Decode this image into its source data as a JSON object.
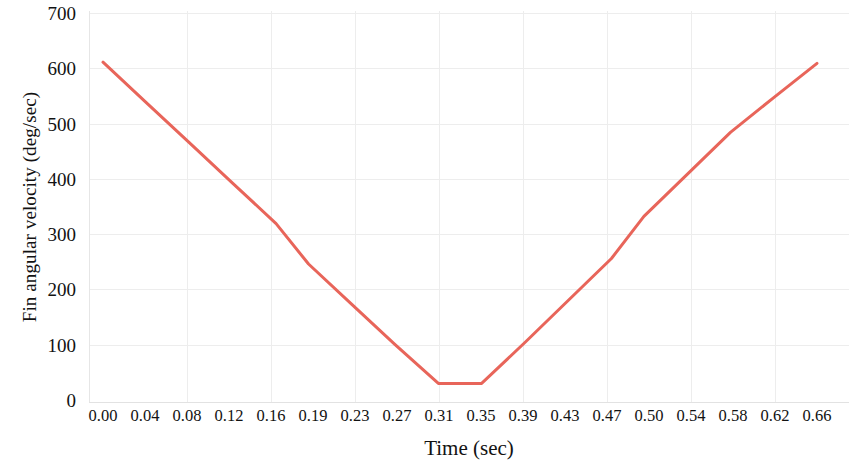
{
  "chart_data": {
    "type": "line",
    "title": "",
    "xlabel": "Time (sec)",
    "ylabel": "Fin angular velocity (deg/sec)",
    "xlim": [
      0.0,
      0.66
    ],
    "ylim": [
      0,
      700
    ],
    "grid": true,
    "legend": false,
    "line_color": "#E8655A",
    "line_width": 3,
    "background_color": "#FFFFFF",
    "grid_color": "#EDEDED",
    "x_tick_labels": [
      "0.00",
      "0.04",
      "0.08",
      "0.12",
      "0.16",
      "0.19",
      "0.23",
      "0.27",
      "0.31",
      "0.35",
      "0.39",
      "0.43",
      "0.47",
      "0.50",
      "0.54",
      "0.58",
      "0.62",
      "0.66"
    ],
    "y_tick_labels": [
      "0",
      "100",
      "200",
      "300",
      "400",
      "500",
      "600",
      "700"
    ],
    "y_tick_values": [
      0,
      100,
      200,
      300,
      400,
      500,
      600,
      700
    ],
    "series": [
      {
        "name": "Fin angular velocity",
        "color": "#E8655A",
        "x": [
          0.0,
          0.04,
          0.08,
          0.12,
          0.16,
          0.19,
          0.23,
          0.27,
          0.31,
          0.35,
          0.39,
          0.43,
          0.47,
          0.5,
          0.54,
          0.58,
          0.62,
          0.66
        ],
        "values": [
          611,
          538,
          465,
          392,
          319,
          246,
          173,
          100,
          30,
          30,
          104,
          180,
          256,
          332,
          408,
          484,
          547,
          609
        ]
      }
    ]
  }
}
